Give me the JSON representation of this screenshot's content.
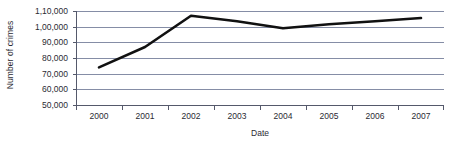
{
  "chart_data": {
    "type": "line",
    "title": "",
    "xlabel": "Date",
    "ylabel": "Number of crimes",
    "categories": [
      "2000",
      "2001",
      "2002",
      "2003",
      "2004",
      "2005",
      "2006",
      "2007"
    ],
    "x": [
      2000,
      2001,
      2002,
      2003,
      2004,
      2005,
      2006,
      2007
    ],
    "values": [
      74000,
      87000,
      107000,
      103500,
      99000,
      101500,
      103500,
      105500
    ],
    "series": [
      {
        "name": "Number of crimes",
        "values": [
          74000,
          87000,
          107000,
          103500,
          99000,
          101500,
          103500,
          105500
        ]
      }
    ],
    "ylim": [
      50000,
      110000
    ],
    "ytick_values": [
      50000,
      60000,
      70000,
      80000,
      90000,
      100000,
      110000
    ],
    "ytick_labels": [
      "50,000",
      "60,000",
      "70,000",
      "80,000",
      "90,000",
      "1,00,000",
      "1,10,000"
    ],
    "grid": "horizontal",
    "legend": "none",
    "line_color": "#111111",
    "gridline_color": "#858da6",
    "axis_color": "#55596b",
    "background_color": "#ffffff"
  }
}
